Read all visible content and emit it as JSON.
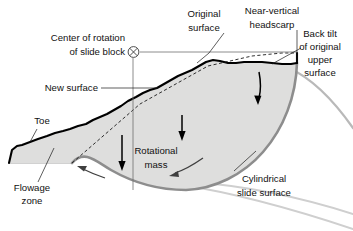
{
  "figure": {
    "type": "diagram",
    "labels": {
      "center_of_rotation_line1": "Center of rotation",
      "center_of_rotation_line2": "of slide block",
      "original_surface_line1": "Original",
      "original_surface_line2": "surface",
      "headscarp_line1": "Near-vertical",
      "headscarp_line2": "headscarp",
      "back_tilt_line1": "Back tilt",
      "back_tilt_line2": "of original",
      "back_tilt_line3": "upper",
      "back_tilt_line4": "surface",
      "new_surface": "New surface",
      "toe": "Toe",
      "flowage_zone_line1": "Flowage",
      "flowage_zone_line2": "zone",
      "rotational_mass_line1": "Rotational",
      "rotational_mass_line2": "mass",
      "cylindrical_line1": "Cylindrical",
      "cylindrical_line2": "slide surface"
    },
    "symbols": {
      "center_of_rotation_marker": "crossed-circle"
    },
    "colors": {
      "mass_fill": "#dededd",
      "new_surface_stroke": "#000000",
      "slide_surface_stroke": "#8d8d8d",
      "ghost_curve": "#b9b9b9",
      "text": "#111111",
      "background": "#ffffff"
    }
  }
}
